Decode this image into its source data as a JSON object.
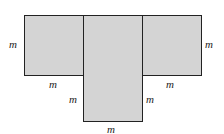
{
  "figure": {
    "fill_color": "#d4d4d4",
    "stroke_color": "#222222",
    "labels": {
      "left_side": "m",
      "left_bottom": "m",
      "center_left": "m",
      "center_right": "m",
      "center_bottom": "m",
      "right_bottom": "m",
      "right_side": "m"
    }
  }
}
